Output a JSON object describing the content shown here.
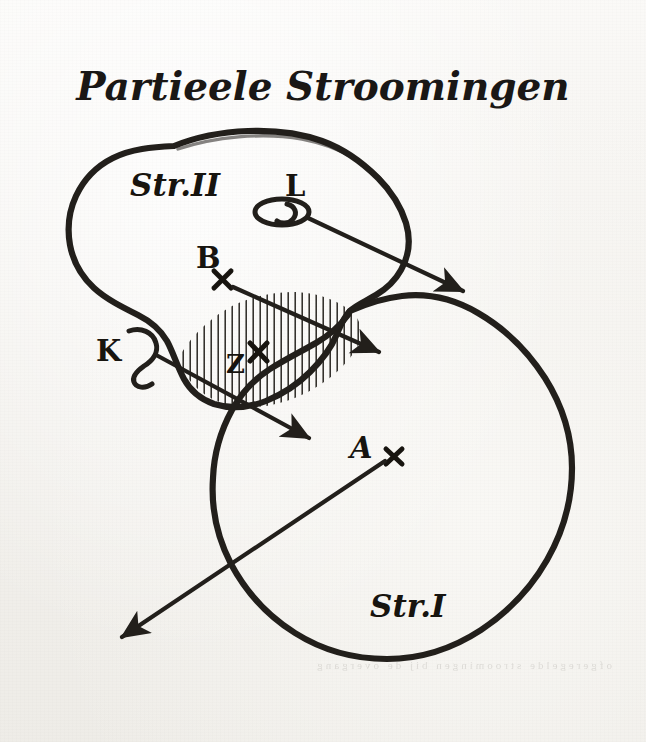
{
  "page": {
    "title": "Partieele Stroomingen",
    "background_color": "#f4f2ee",
    "ink_color": "#221f1b",
    "width": 646,
    "height": 742
  },
  "diagram": {
    "type": "hand-drawn-venn-diagram",
    "regions": [
      {
        "id": "str2",
        "label": "Str.II",
        "label_x": 160,
        "label_y": 186,
        "side": "left-upper"
      },
      {
        "id": "str1",
        "label": "Str.I",
        "label_x": 400,
        "label_y": 606,
        "side": "right-lower"
      },
      {
        "id": "intersection",
        "label": "",
        "hatching": "vertical",
        "hatch_spacing_px": 7
      }
    ],
    "points": [
      {
        "id": "L",
        "label": "L",
        "label_x": 293,
        "label_y": 189,
        "marker": "loop",
        "marker_x": 282,
        "marker_y": 211
      },
      {
        "id": "B",
        "label": "B",
        "label_x": 205,
        "label_y": 259,
        "marker": "cross",
        "marker_x": 222,
        "marker_y": 279
      },
      {
        "id": "K",
        "label": "K",
        "label_x": 96,
        "label_y": 353,
        "marker": "loop",
        "marker_x": 127,
        "marker_y": 352
      },
      {
        "id": "Z",
        "label": "Z",
        "label_x": 235,
        "label_y": 364,
        "marker": "cross",
        "marker_x": 258,
        "marker_y": 352
      },
      {
        "id": "A",
        "label": "A",
        "label_x": 358,
        "label_y": 448,
        "marker": "cross",
        "marker_x": 394,
        "marker_y": 456
      }
    ],
    "arrows": [
      {
        "id": "arrow-L",
        "from": "L",
        "to_x": 468,
        "to_y": 293,
        "direction": "down-right"
      },
      {
        "id": "arrow-B",
        "from": "B",
        "to_x": 382,
        "to_y": 352,
        "direction": "down-right"
      },
      {
        "id": "arrow-K",
        "from": "K",
        "to_x": 313,
        "to_y": 440,
        "direction": "down-right"
      },
      {
        "id": "arrow-A",
        "from": "A",
        "to_x": 118,
        "to_y": 640,
        "direction": "down-left"
      }
    ],
    "bleed_through_text": "ofgeregelde stroomingen bij de overgang"
  }
}
